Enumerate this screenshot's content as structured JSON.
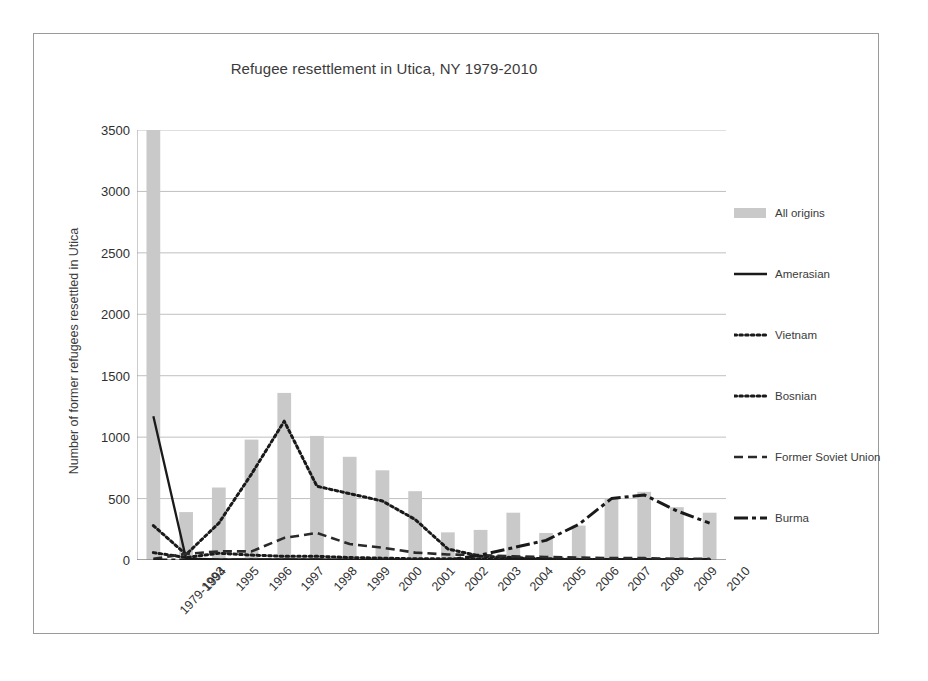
{
  "chart_data": {
    "type": "bar",
    "title": "Refugee resettlement  in Utica, NY 1979-2010",
    "xlabel": "",
    "ylabel": "Number of former refugees resettled in Utica",
    "ylim": [
      0,
      3500
    ],
    "y_ticks": [
      0,
      500,
      1000,
      1500,
      2000,
      2500,
      3000,
      3500
    ],
    "y_tick_labels": [
      "0",
      "500",
      "1000",
      "1500",
      "2000",
      "2500",
      "3000",
      "3500"
    ],
    "grid": true,
    "legend_position": "right",
    "categories": [
      "1979-1993",
      "1994",
      "1995",
      "1996",
      "1997",
      "1998",
      "1999",
      "2000",
      "2001",
      "2002",
      "2003",
      "2004",
      "2005",
      "2006",
      "2007",
      "2008",
      "2009",
      "2010"
    ],
    "bar_series": {
      "name": "All origins",
      "color": "#c9c9c9",
      "values": [
        3530,
        390,
        590,
        980,
        1360,
        1010,
        840,
        730,
        560,
        225,
        245,
        385,
        220,
        280,
        500,
        555,
        430,
        385
      ]
    },
    "series": [
      {
        "name": "Amerasian",
        "style": "solid",
        "color": "#1a1a1a",
        "values": [
          1170,
          10,
          5,
          5,
          5,
          5,
          0,
          0,
          0,
          0,
          0,
          0,
          0,
          0,
          0,
          0,
          0,
          0
        ]
      },
      {
        "name": "Vietnam",
        "style": "dotted",
        "color": "#1a1a1a",
        "values": [
          60,
          20,
          55,
          40,
          30,
          30,
          20,
          15,
          10,
          10,
          10,
          10,
          5,
          5,
          5,
          5,
          5,
          5
        ]
      },
      {
        "name": "Bosnian",
        "style": "dotted",
        "color": "#1a1a1a",
        "values": [
          280,
          45,
          300,
          700,
          1130,
          600,
          540,
          480,
          330,
          90,
          30,
          20,
          10,
          5,
          5,
          5,
          5,
          5
        ]
      },
      {
        "name": "Former Soviet Union",
        "style": "dashed",
        "color": "#2a2a2a",
        "values": [
          10,
          50,
          70,
          70,
          180,
          220,
          130,
          100,
          60,
          45,
          40,
          30,
          25,
          20,
          15,
          15,
          10,
          10
        ]
      },
      {
        "name": "Burma",
        "style": "dashdot",
        "color": "#1a1a1a",
        "values": [
          0,
          0,
          0,
          0,
          0,
          0,
          0,
          0,
          0,
          0,
          40,
          100,
          160,
          290,
          500,
          530,
          400,
          300
        ]
      }
    ]
  }
}
